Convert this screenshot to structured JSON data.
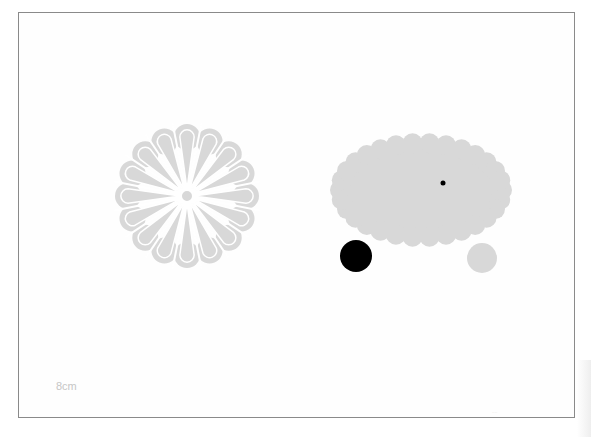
{
  "diagram": {
    "scale_label": "8cm",
    "footer_mark": "····",
    "colors": {
      "shape_fill": "#d8d8d8",
      "dark": "#000000",
      "frame": "#8a8a8a",
      "label": "#c6c6c6"
    },
    "shapes": [
      {
        "id": "flower",
        "type": "flower",
        "petals": 16,
        "cx": 187,
        "cy": 196,
        "r": 72,
        "fill": "gray"
      },
      {
        "id": "scalloped-ellipse",
        "type": "scalloped-ellipse",
        "cx": 421,
        "cy": 190,
        "rx": 90,
        "ry": 56,
        "fill": "gray"
      },
      {
        "id": "center-dot",
        "type": "circle",
        "cx": 443,
        "cy": 183,
        "r": 2.5,
        "fill": "black"
      },
      {
        "id": "black-circle",
        "type": "circle",
        "cx": 356,
        "cy": 256,
        "r": 16,
        "fill": "black"
      },
      {
        "id": "gray-circle",
        "type": "circle",
        "cx": 482,
        "cy": 258,
        "r": 15,
        "fill": "gray"
      }
    ]
  }
}
